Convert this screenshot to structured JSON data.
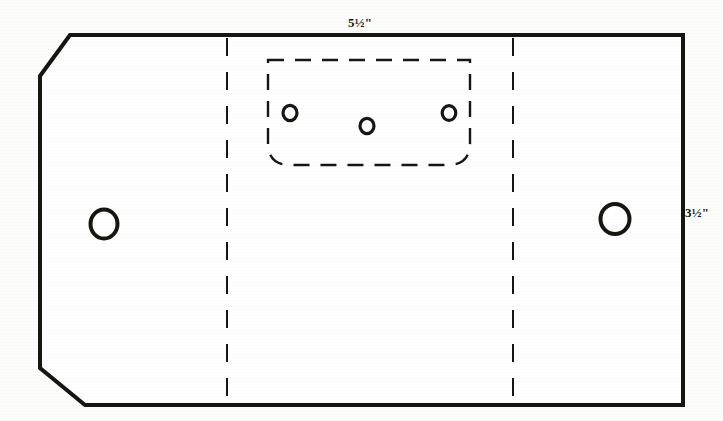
{
  "document": {
    "type": "technical-pattern-drawing",
    "subject": "flat cut-out pattern with fold lines, grommet holes and stitch-hole panel",
    "background_color": "#fdfdfb",
    "ink_color": "#16150f"
  },
  "dimensions": {
    "top_label": "5½\"",
    "right_label": "3½\""
  },
  "outline": {
    "stroke_color": "#16150f",
    "stroke_width": 4,
    "description": "rectangle with chamfered left corners and square right corners",
    "points": "70,35 683,35 683,405 85,405 40,368 40,76",
    "closed": true
  },
  "fold_lines": [
    {
      "name": "left-fold-line",
      "x": 227,
      "y_start": 38,
      "y_end": 402,
      "stroke_color": "#16150f",
      "stroke_width": 2,
      "dash": "18 16"
    },
    {
      "name": "right-fold-line",
      "x": 513,
      "y_start": 38,
      "y_end": 402,
      "stroke_color": "#16150f",
      "stroke_width": 2,
      "dash": "18 16"
    }
  ],
  "dashed_panel": {
    "name": "stitch-panel",
    "x": 268,
    "y": 60,
    "width": 202,
    "height": 105,
    "corner_radius_bottom": 22,
    "stroke_color": "#16150f",
    "stroke_width": 2.4,
    "dash": "16 11"
  },
  "small_holes": [
    {
      "name": "stitch-hole-left",
      "cx": 290,
      "cy": 113,
      "r": 7.2
    },
    {
      "name": "stitch-hole-center",
      "cx": 367,
      "cy": 126,
      "r": 7.2
    },
    {
      "name": "stitch-hole-right",
      "cx": 449,
      "cy": 113,
      "r": 7.2
    }
  ],
  "large_holes": [
    {
      "name": "grommet-hole-left",
      "cx": 104,
      "cy": 224,
      "r": 14
    },
    {
      "name": "grommet-hole-right",
      "cx": 615,
      "cy": 219,
      "r": 15
    }
  ],
  "hole_stroke": {
    "color": "#16150f",
    "small_width": 3.2,
    "large_width": 4
  }
}
